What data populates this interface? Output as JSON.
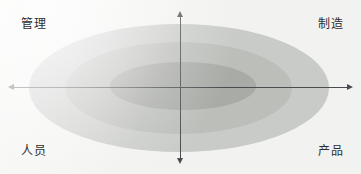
{
  "figure": {
    "background_color": "#f2f2f0"
  },
  "chart_data": {
    "type": "diagram",
    "subtype": "concentric-ellipse-quadrant",
    "title": "",
    "xlabel": "",
    "ylabel": "",
    "grid": false,
    "legend": null,
    "axes": {
      "horizontal": {
        "arrows": [
          "left",
          "right"
        ],
        "color": "#4a4d50",
        "left_label": "人员",
        "right_label": "产品"
      },
      "vertical": {
        "arrows": [
          "up",
          "down"
        ],
        "color": "#4a4d50",
        "top_label": "管理",
        "bottom_label": "制造"
      }
    },
    "quadrant_labels": [
      {
        "position": "top-left",
        "text": "管理"
      },
      {
        "position": "top-right",
        "text": "制造"
      },
      {
        "position": "bottom-left",
        "text": "人员"
      },
      {
        "position": "bottom-right",
        "text": "产品"
      }
    ],
    "ellipses": [
      {
        "name": "outer",
        "color": "#c9cbc8",
        "rx": 150,
        "ry": 64,
        "cx": 179,
        "cy": 88
      },
      {
        "name": "middle",
        "color": "#bcbeba",
        "rx": 113,
        "ry": 46,
        "cx": 179,
        "cy": 88
      },
      {
        "name": "inner",
        "color": "#a9aba7",
        "rx": 73,
        "ry": 24,
        "cx": 183,
        "cy": 86
      }
    ]
  },
  "labels": {
    "top_left": "管理",
    "top_right": "制造",
    "bottom_left": "人员",
    "bottom_right": "产品"
  },
  "colors": {
    "background": "#f2f2f0",
    "ellipse_outer": "#c9cbc8",
    "ellipse_middle": "#bcbeba",
    "ellipse_inner": "#a9aba7",
    "axis": "#4a4d50",
    "text": "#2e2e2e"
  }
}
